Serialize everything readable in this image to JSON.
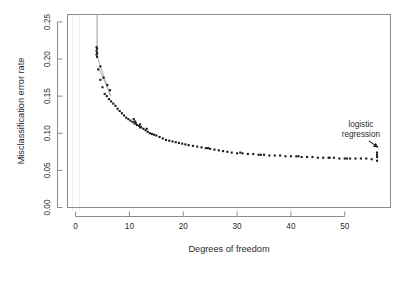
{
  "chart_data": {
    "type": "scatter",
    "title": "",
    "xlabel": "Degrees of freedom",
    "ylabel": "Misclassification error rate",
    "xlim": [
      -1.5,
      58.5
    ],
    "ylim": [
      0.0,
      0.26
    ],
    "xticks": [
      0,
      10,
      20,
      30,
      40,
      50
    ],
    "yticks": [
      0.0,
      0.05,
      0.1,
      0.15,
      0.2,
      0.25
    ],
    "xticklabels": [
      "0",
      "10",
      "20",
      "30",
      "40",
      "50"
    ],
    "yticklabels": [
      "0.00",
      "0.05",
      "0.10",
      "0.15",
      "0.20",
      "0.25"
    ],
    "grid": false,
    "legend": null,
    "marker": "filled-square",
    "marker_color": "#1a1a1a",
    "line_color": "#9a9a9a",
    "annotations": [
      {
        "text_line1": "logistic",
        "text_line2": "regression",
        "x": 53.0,
        "y": 0.108,
        "arrow_to_x": 56.2,
        "arrow_to_y": 0.081
      }
    ],
    "x": [
      4.0,
      4.0,
      4.0,
      4.2,
      4.6,
      5.0,
      5.4,
      5.8,
      6.2,
      6.6,
      7.0,
      7.4,
      7.8,
      8.2,
      8.6,
      9.0,
      9.4,
      9.8,
      10.2,
      10.6,
      11.0,
      11.4,
      11.8,
      12.2,
      12.6,
      13.0,
      13.4,
      13.8,
      14.2,
      14.6,
      15.0,
      15.6,
      16.2,
      16.8,
      17.4,
      18.0,
      18.6,
      19.2,
      19.8,
      20.4,
      21.0,
      21.8,
      22.6,
      23.4,
      24.2,
      25.0,
      25.8,
      26.6,
      27.4,
      28.2,
      29.0,
      30.0,
      31.0,
      32.0,
      33.0,
      34.0,
      35.0,
      36.0,
      37.0,
      38.0,
      39.0,
      40.0,
      41.0,
      42.0,
      43.0,
      44.0,
      45.0,
      46.0,
      47.0,
      48.0,
      49.0,
      50.0,
      51.0,
      52.0,
      53.0,
      54.0,
      55.0,
      56.0,
      56.0,
      56.0,
      3.9,
      3.9,
      3.9,
      4.6,
      5.2,
      5.9,
      6.4,
      10.8,
      11.0,
      11.2,
      12.0,
      12.0,
      13.2,
      24.6,
      30.6,
      34.4,
      41.4,
      47.2,
      50.4,
      56.0
    ],
    "y": [
      0.214,
      0.208,
      0.203,
      0.186,
      0.172,
      0.162,
      0.153,
      0.15,
      0.146,
      0.143,
      0.14,
      0.137,
      0.133,
      0.13,
      0.127,
      0.124,
      0.121,
      0.119,
      0.117,
      0.115,
      0.113,
      0.111,
      0.11,
      0.108,
      0.106,
      0.104,
      0.102,
      0.1,
      0.099,
      0.098,
      0.097,
      0.095,
      0.093,
      0.091,
      0.09,
      0.089,
      0.088,
      0.087,
      0.086,
      0.085,
      0.084,
      0.083,
      0.082,
      0.081,
      0.08,
      0.079,
      0.078,
      0.077,
      0.076,
      0.075,
      0.074,
      0.073,
      0.073,
      0.072,
      0.072,
      0.071,
      0.071,
      0.07,
      0.07,
      0.07,
      0.069,
      0.069,
      0.069,
      0.068,
      0.068,
      0.068,
      0.067,
      0.067,
      0.067,
      0.067,
      0.066,
      0.066,
      0.066,
      0.066,
      0.066,
      0.066,
      0.065,
      0.074,
      0.068,
      0.063,
      0.216,
      0.211,
      0.206,
      0.19,
      0.175,
      0.165,
      0.158,
      0.119,
      0.116,
      0.114,
      0.112,
      0.108,
      0.106,
      0.08,
      0.074,
      0.071,
      0.069,
      0.067,
      0.066,
      0.071
    ],
    "overflow_line": {
      "x": 4.0,
      "y_top": 0.26,
      "y_bottom": 0.214,
      "note": "series continues above plot range"
    },
    "connector_segments": [
      {
        "x1": 3.9,
        "y1": 0.206,
        "x2": 6.4,
        "y2": 0.152
      },
      {
        "x1": 4.3,
        "y1": 0.188,
        "x2": 6.6,
        "y2": 0.15
      }
    ]
  },
  "axes": {
    "x_title": "Degrees of freedom",
    "y_title": "Misclassification error rate"
  },
  "annotation": {
    "line1": "logistic",
    "line2": "regression"
  },
  "colors": {
    "marker": "#1a1a1a",
    "frame": "#8c8c8c",
    "line": "#9a9a9a",
    "text": "#2b2b2b",
    "background": "#ffffff"
  }
}
